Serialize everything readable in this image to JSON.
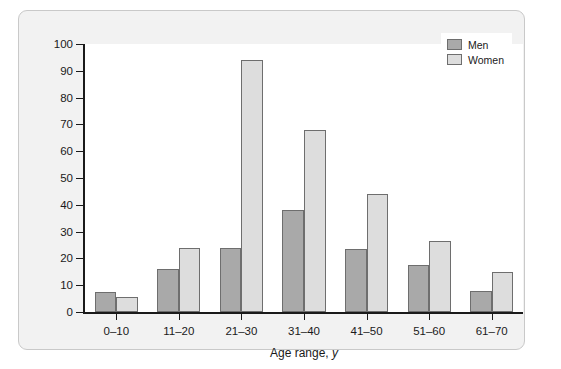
{
  "chart_data": {
    "type": "bar",
    "title": "",
    "xlabel": "Age range, y",
    "ylabel": "",
    "categories": [
      "0–10",
      "11–20",
      "21–30",
      "31–40",
      "41–50",
      "51–60",
      "61–70"
    ],
    "series": [
      {
        "name": "Men",
        "color": "#a9a9a9",
        "values": [
          7.5,
          16,
          24,
          38,
          23.5,
          17.5,
          8
        ]
      },
      {
        "name": "Women",
        "color": "#dddddd",
        "values": [
          5.5,
          24,
          94,
          68,
          44,
          26.5,
          15
        ]
      }
    ],
    "ylim": [
      0,
      100
    ],
    "yticks": [
      0,
      10,
      20,
      30,
      40,
      50,
      60,
      70,
      80,
      90,
      100
    ],
    "ytick_labels": [
      "0",
      "10",
      "20",
      "30",
      "40",
      "50",
      "60",
      "70",
      "80",
      "90",
      "100"
    ],
    "grid": false,
    "legend_position": "top-right"
  },
  "legend": {
    "entries": [
      {
        "label": "Men"
      },
      {
        "label": "Women"
      }
    ]
  },
  "axis": {
    "x_title_text": "Age range,",
    "x_title_unit": "y"
  }
}
